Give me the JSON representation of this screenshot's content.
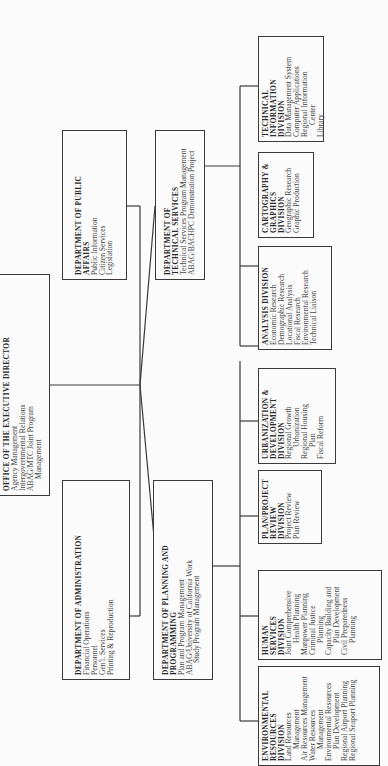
{
  "orientation": "rotated-90-ccw",
  "executive": {
    "title": "OFFICE OF THE EXECUTIVE DIRECTOR",
    "items": [
      "Agency Management",
      "Intergovernmental Relations",
      "ABAG/MTC Joint Program",
      "Management"
    ]
  },
  "departments": [
    {
      "title": "DEPARTMENT OF ADMINISTRATION",
      "items": [
        "Financial Operations",
        "Personnel",
        "Gen'l. Services",
        "Printing & Reproduction"
      ]
    },
    {
      "title": "DEPARTMENT OF PLANNING AND PROGRAMMING",
      "items": [
        "Plan and Program Management",
        "ABAG/University of California Work",
        "Study Program Management"
      ]
    },
    {
      "title": "DEPARTMENT OF PUBLIC AFFAIRS",
      "items": [
        "Public Information",
        "Citizen Services",
        "Legislation"
      ]
    },
    {
      "title": "DEPARTMENT OF TECHNICAL SERVICES",
      "items": [
        "Technical Services Program Management",
        "ABAG/BACHPC Demonstration Project"
      ]
    }
  ],
  "divisions": [
    {
      "title": "ENVIRONMENTAL RESOURCES DIVISION",
      "items": [
        "Land Resources",
        "Management",
        "Air Resources Management",
        "Water Resources",
        "Management",
        "Environmental Resources",
        "Plan Development",
        "Regional Airport Planning",
        "Regional Seaport Planning"
      ]
    },
    {
      "title": "HUMAN SERVICES DIVISION",
      "items": [
        "Joint Comprehensive",
        "Health Planning",
        "Manpower Planning",
        "Criminal Justice",
        "Planning",
        "Capacity Building and",
        "Plan Development",
        "Civil Preparedness",
        "Planning"
      ]
    },
    {
      "title": "PLAN/PROJECT REVIEW DIVISION",
      "items": [
        "Project Review",
        "Plan Review"
      ]
    },
    {
      "title": "URBANIZATION & DEVELOPMENT DIVISION",
      "items": [
        "Regional Growth",
        "Urbanization",
        "Regional Housing",
        "Plan",
        "Fiscal Reform"
      ]
    },
    {
      "title": "ANALYSIS DIVISION",
      "items": [
        "Economic Research",
        "Demographic Research",
        "Locational Analysis",
        "Fiscal Research",
        "Environmental Research",
        "Technical Liaison"
      ]
    },
    {
      "title": "CARTOGRAPHY & GRAPHICS DIVISION",
      "items": [
        "Geographic Research",
        "Graphic Production"
      ]
    },
    {
      "title": "TECHNICAL INFORMATION DIVISION",
      "items": [
        "Data Management System",
        "Computer Applications",
        "Regional Information",
        "Center",
        "Library"
      ]
    }
  ]
}
